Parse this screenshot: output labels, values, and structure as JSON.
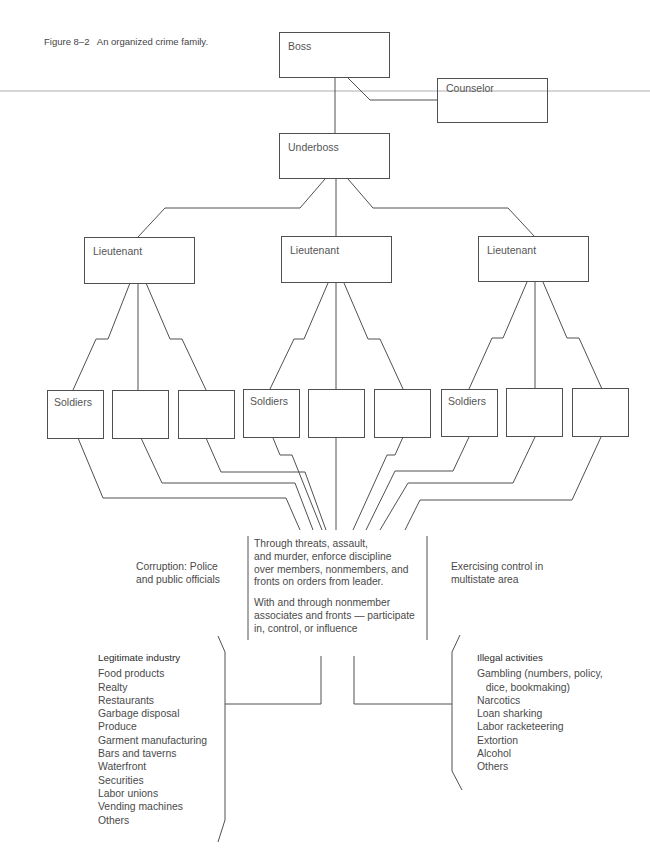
{
  "figure": {
    "caption": "Figure 8–2   An organized crime family."
  },
  "nodes": {
    "boss": "Boss",
    "counselor": "Counselor",
    "underboss": "Underboss",
    "lieutenants": [
      "Lieutenant",
      "Lieutenant",
      "Lieutenant"
    ],
    "soldiers": [
      [
        "Soldiers",
        "",
        ""
      ],
      [
        "Soldiers",
        "",
        ""
      ],
      [
        "Soldiers",
        "",
        ""
      ]
    ]
  },
  "notes": {
    "corruption": "Corruption: Police\nand public officials",
    "multistate": "Exercising control in\nmultistate area",
    "discipline": "Through threats, assault,\nand murder, enforce discipline\nover members, nonmembers, and\nfronts on orders from leader.",
    "associates": "With and through nonmember\nassociates and fronts — participate\nin, control, or influence"
  },
  "legitimate_industry": {
    "heading": "Legitimate industry",
    "items": [
      "Food products",
      "Realty",
      "Restaurants",
      "Garbage disposal",
      "Produce",
      "Garment manufacturing",
      "Bars and taverns",
      "Waterfront",
      "Securities",
      "Labor unions",
      "Vending machines",
      "Others"
    ]
  },
  "illegal_activities": {
    "heading": "Illegal activities",
    "items": [
      "Gambling (numbers, policy,",
      "   dice, bookmaking)",
      "Narcotics",
      "Loan sharking",
      "Labor racketeering",
      "Extortion",
      "Alcohol",
      "Others"
    ]
  },
  "colors": {
    "line": "#505050",
    "scan_line": "#9a9a9a",
    "text": "#4a4a4a"
  }
}
